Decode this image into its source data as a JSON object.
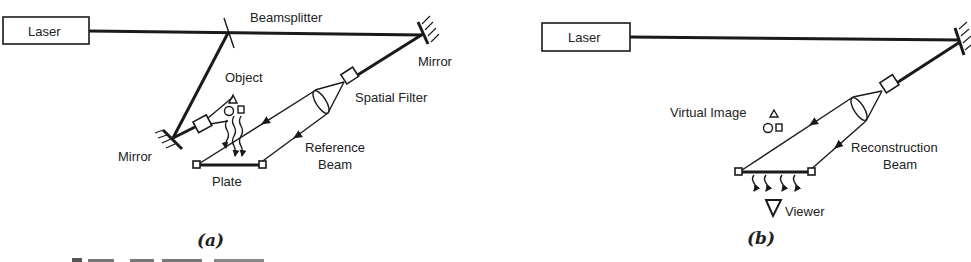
{
  "diagram_a": {
    "caption": "(a)",
    "laser_label": "Laser",
    "beamsplitter_label": "Beamsplitter",
    "mirror_right_label": "Mirror",
    "mirror_left_label": "Mirror",
    "object_label": "Object",
    "spatial_filter_label": "Spatial Filter",
    "reference_beam_label_line1": "Reference",
    "reference_beam_label_line2": "Beam",
    "plate_label": "Plate"
  },
  "diagram_b": {
    "caption": "(b)",
    "laser_label": "Laser",
    "virtual_image_label": "Virtual Image",
    "reconstruction_beam_label_line1": "Reconstruction",
    "reconstruction_beam_label_line2": "Beam",
    "viewer_label": "Viewer"
  },
  "colors": {
    "ink": "#1a1a1a",
    "background": "#ffffff"
  }
}
